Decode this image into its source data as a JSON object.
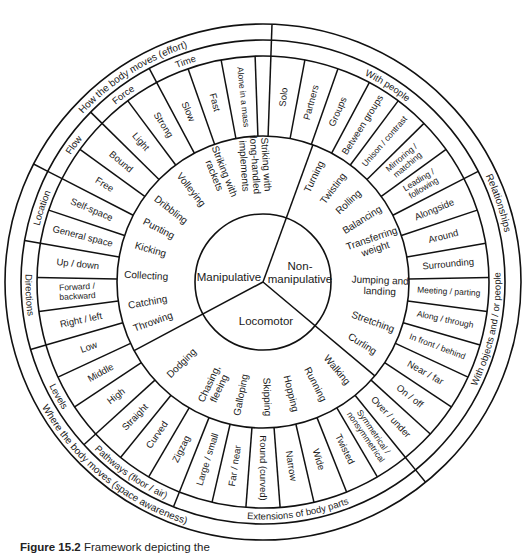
{
  "figure": {
    "caption_label": "Figure 15.2",
    "caption_text": "Framework depicting the"
  },
  "center": {
    "sectors": [
      {
        "label": "Manipulative"
      },
      {
        "label": "Non-\nmanipulative"
      },
      {
        "label": "Locomotor"
      }
    ]
  },
  "skills": {
    "manipulative": [
      "Striking with\nlong-handled\nimplements",
      "Striking with\nrackets",
      "Volleying",
      "Dribbling",
      "Punting",
      "Kicking",
      "Collecting",
      "Catching",
      "Throwing"
    ],
    "non_manipulative": [
      "Turning",
      "Twisting",
      "Rolling",
      "Balancing",
      "Transferring\nweight",
      "Jumping and\nlanding",
      "Stretching",
      "Curling"
    ],
    "locomotor": [
      "Walking",
      "Running",
      "Hopping",
      "Skipping",
      "Galloping",
      "Chasing,\nfleeing",
      "Dodging"
    ]
  },
  "concepts": {
    "effort": {
      "title": "How the body moves (effort)",
      "groups": [
        {
          "label": "Time",
          "items": [
            "Fast",
            "Slow"
          ]
        },
        {
          "label": "Force",
          "items": [
            "Strong",
            "Light"
          ]
        },
        {
          "label": "Flow",
          "items": [
            "Bound",
            "Free"
          ]
        }
      ]
    },
    "space": {
      "title": "Where the body moves (space awareness)",
      "groups": [
        {
          "label": "Location",
          "items": [
            "Self-space",
            "General space"
          ]
        },
        {
          "label": "Directions",
          "items": [
            "Up / down",
            "Forward /\nbackward",
            "Right / left"
          ]
        },
        {
          "label": "Levels",
          "items": [
            "Low",
            "Middle",
            "High"
          ]
        },
        {
          "label": "Pathways (floor / air)",
          "items": [
            "Straight",
            "Curved",
            "Zigzag"
          ]
        },
        {
          "label": "Extensions of body parts",
          "items": [
            "Large / small",
            "Far / near"
          ]
        }
      ]
    },
    "body": {
      "title": "",
      "groups": [
        {
          "label": "Extensions of body parts",
          "items": [
            "Round (curved)",
            "Narrow",
            "Wide",
            "Twisted",
            "Symmetrical /\nnonsymmetrical"
          ]
        }
      ]
    },
    "relationships": {
      "title": "Relationships",
      "groups": [
        {
          "label": "With objects and / or people",
          "items": [
            "Over / under",
            "On / off",
            "Near / far",
            "In front / behind",
            "Along / through",
            "Meeting / parting",
            "Surrounding",
            "Around",
            "Alongside"
          ]
        },
        {
          "label": "With people",
          "items": [
            "Leading /\nfollowing",
            "Mirroring /\nmatching",
            "Unison / contrast",
            "Between groups",
            "Groups",
            "Partners",
            "Solo",
            "Alone in a mass"
          ]
        }
      ]
    }
  }
}
